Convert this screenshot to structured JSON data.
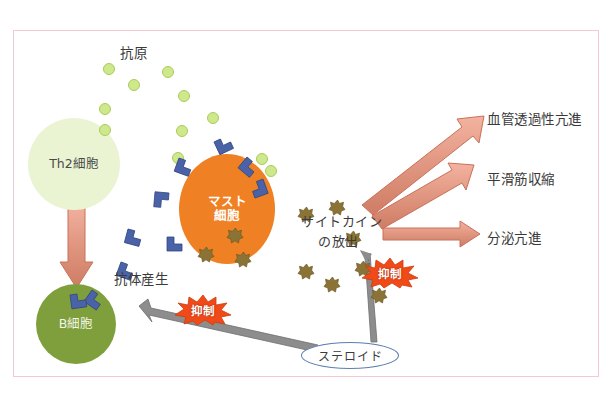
{
  "diagram": {
    "title_text": "",
    "border_color": "#f4c9cf",
    "labels": {
      "antigen": "抗原",
      "th2_cell": "Th2細胞",
      "mast_cell_line1": "マスト",
      "mast_cell_line2": "細胞",
      "b_cell": "B細胞",
      "antibody_production": "抗体産生",
      "cytokine_release_line1": "サイトカイン",
      "cytokine_release_line2": "の放出",
      "steroid": "ステロイド",
      "vascular_permeability": "血管透過性亢進",
      "smooth_muscle_contraction": "平滑筋収縮",
      "secretion_increase": "分泌亢進",
      "suppression_1": "抑制",
      "suppression_2": "抑制"
    },
    "colors": {
      "antigen_fill": "#cfe88c",
      "antigen_stroke": "#a9cc5c",
      "th2_fill": "#eaf4d3",
      "mast_fill": "#ef8023",
      "bcell_fill": "#7e9f3c",
      "antibody_fill": "#4a63a8",
      "granule_fill": "#8a7334",
      "arrow_salmon": "#e09680",
      "arrow_gray": "#8d8d8d",
      "burst_orange": "#f04a18",
      "steroid_stroke": "#5b7fb0"
    },
    "antigen_dots": [
      {
        "x": 103,
        "y": 63
      },
      {
        "x": 128,
        "y": 79
      },
      {
        "x": 162,
        "y": 66
      },
      {
        "x": 99,
        "y": 103
      },
      {
        "x": 178,
        "y": 90
      },
      {
        "x": 99,
        "y": 124
      },
      {
        "x": 176,
        "y": 125
      },
      {
        "x": 207,
        "y": 112
      },
      {
        "x": 256,
        "y": 153
      },
      {
        "x": 172,
        "y": 152
      },
      {
        "x": 265,
        "y": 165
      }
    ],
    "antibodies": [
      {
        "x": 179,
        "y": 158,
        "rot": 20
      },
      {
        "x": 214,
        "y": 142,
        "rot": -25
      },
      {
        "x": 244,
        "y": 155,
        "rot": 35
      },
      {
        "x": 169,
        "y": 193,
        "rot": 95
      },
      {
        "x": 251,
        "y": 196,
        "rot": -110
      },
      {
        "x": 128,
        "y": 229,
        "rot": 15
      },
      {
        "x": 167,
        "y": 237,
        "rot": 0
      },
      {
        "x": 121,
        "y": 260,
        "rot": 20
      },
      {
        "x": 90,
        "y": 288,
        "rot": 40
      },
      {
        "x": 72,
        "y": 292,
        "rot": -10
      }
    ],
    "granules": [
      {
        "x": 228,
        "y": 228
      },
      {
        "x": 199,
        "y": 247
      },
      {
        "x": 236,
        "y": 252
      },
      {
        "x": 299,
        "y": 207
      },
      {
        "x": 330,
        "y": 200
      },
      {
        "x": 346,
        "y": 231
      },
      {
        "x": 299,
        "y": 264
      },
      {
        "x": 325,
        "y": 277
      },
      {
        "x": 356,
        "y": 261
      },
      {
        "x": 372,
        "y": 288
      }
    ],
    "arrows": {
      "th2_to_b": {
        "type": "salmon-down"
      },
      "vascular": {
        "type": "salmon-diagonal"
      },
      "smooth_muscle": {
        "type": "salmon-diagonal"
      },
      "secretion": {
        "type": "salmon-horizontal"
      },
      "steroid_to_antibody": {
        "type": "gray"
      },
      "steroid_to_cytokine": {
        "type": "gray"
      }
    }
  }
}
